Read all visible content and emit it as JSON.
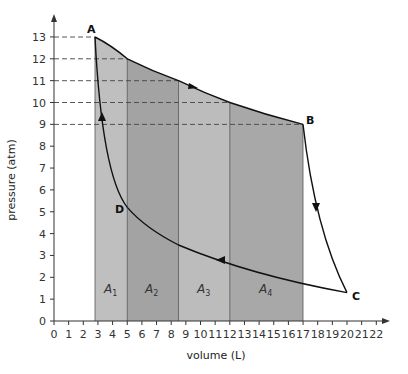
{
  "chart_data": {
    "type": "line",
    "title": "",
    "xlabel": "volume (L)",
    "ylabel": "pressure (atm)",
    "xlim": [
      0,
      22
    ],
    "ylim": [
      0,
      13
    ],
    "x_ticks": [
      0,
      1,
      2,
      3,
      4,
      5,
      6,
      7,
      8,
      9,
      10,
      11,
      12,
      13,
      14,
      15,
      16,
      17,
      18,
      19,
      20,
      21,
      22
    ],
    "y_ticks": [
      0,
      1,
      2,
      3,
      4,
      5,
      6,
      7,
      8,
      9,
      10,
      11,
      12,
      13
    ],
    "grid": false,
    "points": [
      {
        "label": "A",
        "x": 2.8,
        "y": 13
      },
      {
        "label": "B",
        "x": 17,
        "y": 9
      },
      {
        "label": "C",
        "x": 20,
        "y": 1.3
      },
      {
        "label": "D",
        "x": 5,
        "y": 5.2
      }
    ],
    "series": [
      {
        "name": "A→B",
        "x": [
          2.8,
          5,
          8.5,
          12,
          17
        ],
        "y": [
          13,
          12,
          11,
          10,
          9
        ],
        "direction": "A to B"
      },
      {
        "name": "B→C",
        "x": [
          17,
          20
        ],
        "y": [
          9,
          1.3
        ],
        "direction": "B to C"
      },
      {
        "name": "C→D",
        "x": [
          20,
          12,
          8.5,
          5
        ],
        "y": [
          1.3,
          2.7,
          3.6,
          5.2
        ],
        "direction": "C to D"
      },
      {
        "name": "D→A",
        "x": [
          5,
          2.8
        ],
        "y": [
          5.2,
          13
        ],
        "direction": "D to A"
      }
    ],
    "shaded_areas": [
      {
        "label": "A1",
        "x_from": 2.8,
        "x_to": 5,
        "top_p": [
          13,
          12
        ],
        "color": "#bfbfbf"
      },
      {
        "label": "A2",
        "x_from": 5,
        "x_to": 8.5,
        "top_p": [
          12,
          11
        ],
        "color": "#a3a3a3"
      },
      {
        "label": "A3",
        "x_from": 8.5,
        "x_to": 12,
        "top_p": [
          11,
          10
        ],
        "color": "#bcbcbc"
      },
      {
        "label": "A4",
        "x_from": 12,
        "x_to": 17,
        "top_p": [
          10,
          9
        ],
        "color": "#a8a8a8"
      }
    ],
    "dashed_guides": [
      {
        "p": 13,
        "to_v": 2.8
      },
      {
        "p": 12,
        "to_v": 5
      },
      {
        "p": 11,
        "to_v": 8.5
      },
      {
        "p": 10,
        "to_v": 12
      },
      {
        "p": 9,
        "to_v": 17
      }
    ]
  },
  "labels": {
    "xlabel": "volume (L)",
    "ylabel": "pressure (atm)",
    "A": "A",
    "B": "B",
    "C": "C",
    "D": "D",
    "areas": [
      "A",
      "A",
      "A",
      "A"
    ],
    "area_subs": [
      "1",
      "2",
      "3",
      "4"
    ]
  }
}
